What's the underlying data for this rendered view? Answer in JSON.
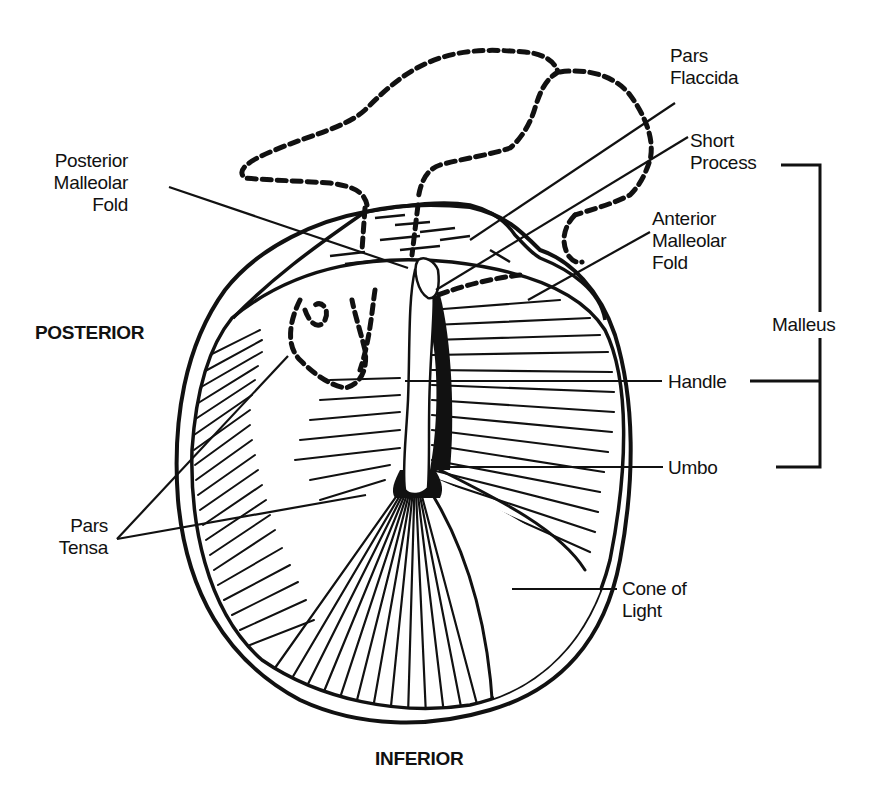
{
  "diagram": {
    "orientation": {
      "posterior": "POSTERIOR",
      "inferior": "INFERIOR"
    },
    "labels": {
      "pars_flaccida": [
        "Pars",
        "Flaccida"
      ],
      "short_process": [
        "Short",
        "Process"
      ],
      "anterior_malleolar_fold": [
        "Anterior",
        "Malleolar",
        "Fold"
      ],
      "posterior_malleolar_fold": [
        "Posterior",
        "Malleolar",
        "Fold"
      ],
      "malleus": "Malleus",
      "handle": "Handle",
      "umbo": "Umbo",
      "pars_tensa": [
        "Pars",
        "Tensa"
      ],
      "cone_of_light": [
        "Cone of",
        "Light"
      ]
    },
    "groups": {
      "malleus_bracket": [
        "Short Process",
        "Handle",
        "Umbo"
      ]
    },
    "colors": {
      "ink": "#111111",
      "paper": "#ffffff"
    }
  }
}
